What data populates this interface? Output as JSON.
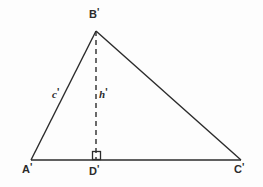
{
  "figure": {
    "background_color": "#fdfdfd",
    "stroke_color": "#2b2b2b",
    "vertices": {
      "a": {
        "label": "A",
        "prime": "'",
        "x": 31,
        "y": 160
      },
      "b": {
        "label": "B",
        "prime": "'",
        "x": 96,
        "y": 31
      },
      "c": {
        "label": "C",
        "prime": "'",
        "x": 241,
        "y": 160
      },
      "d": {
        "label": "D",
        "prime": "'",
        "x": 96,
        "y": 160
      }
    },
    "segments": {
      "side_c": {
        "label": "c",
        "prime": "'",
        "from": "a",
        "to": "b",
        "style": "solid"
      },
      "side_a": {
        "label": "",
        "prime": "",
        "from": "b",
        "to": "c",
        "style": "solid"
      },
      "base_b": {
        "label": "",
        "prime": "",
        "from": "a",
        "to": "c",
        "style": "solid"
      },
      "altitude_h": {
        "label": "h",
        "prime": "'",
        "from": "b",
        "to": "d",
        "style": "dashed"
      }
    },
    "right_angle_marker": {
      "name": "right-angle-square",
      "at_vertex": "d",
      "size": 8
    }
  }
}
